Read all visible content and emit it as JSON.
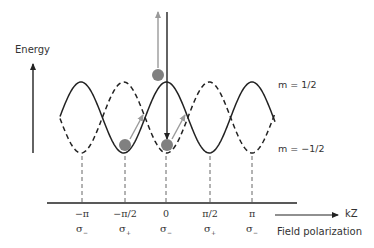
{
  "figure": {
    "y_axis_label": "Energy",
    "x_axis_label": "kZ",
    "x_axis_caption": "Field polarization",
    "curves": [
      {
        "name": "m-plus-half",
        "label": "m = 1/2",
        "style": "solid",
        "color": "#222222"
      },
      {
        "name": "m-minus-half",
        "label": "m = −1/2",
        "style": "dashed",
        "color": "#222222"
      }
    ],
    "ticks": [
      {
        "position": "−π",
        "polarization": "σ",
        "sub": "−",
        "x": 82
      },
      {
        "position": "−π/2",
        "polarization": "σ",
        "sub": "+",
        "x": 125
      },
      {
        "position": "0",
        "polarization": "σ",
        "sub": "−",
        "x": 166
      },
      {
        "position": "π/2",
        "polarization": "σ",
        "sub": "+",
        "x": 210
      },
      {
        "position": "π",
        "polarization": "σ",
        "sub": "−",
        "x": 252
      }
    ],
    "atoms": [
      {
        "name": "atom-excited",
        "x": 158,
        "y": 75,
        "color": "#808080"
      },
      {
        "name": "atom-left-well",
        "x": 125,
        "y": 145,
        "color": "#808080"
      },
      {
        "name": "atom-center-well",
        "x": 167,
        "y": 145,
        "color": "#808080"
      }
    ],
    "colors": {
      "curve": "#222222",
      "gray_arrow": "#9a9a9a",
      "atom": "#808080",
      "text": "#333333"
    }
  }
}
